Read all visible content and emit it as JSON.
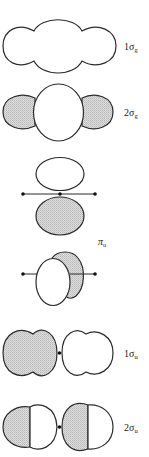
{
  "figure": {
    "shade_color": "#cfcfcf",
    "outline_color": "#2b2b2b",
    "orbitals": [
      {
        "id": "1sg",
        "prefix": "1",
        "symbol": "σ",
        "subscript": "g"
      },
      {
        "id": "2sg",
        "prefix": "2",
        "symbol": "σ",
        "subscript": "g"
      },
      {
        "id": "pu",
        "prefix": "",
        "symbol": "π",
        "subscript": "u"
      },
      {
        "id": "1su",
        "prefix": "1",
        "symbol": "σ",
        "subscript": "u"
      },
      {
        "id": "2su",
        "prefix": "2",
        "symbol": "σ",
        "subscript": "u"
      }
    ]
  }
}
